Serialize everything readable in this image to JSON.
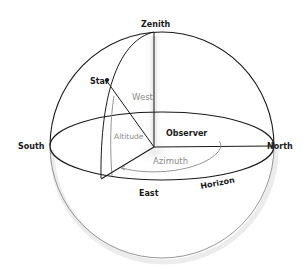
{
  "diagram": {
    "labels": {
      "zenith": "Zenith",
      "star": "Star",
      "west": "West",
      "south": "South",
      "north": "North",
      "east": "East",
      "altitude": "Altitude",
      "observer": "Observer",
      "azimuth": "Azimuth",
      "horizon": "Horizon"
    },
    "colors": {
      "line": "#1a1a1a",
      "muted_line": "#8a8a8a",
      "muted_text": "#8a8a8a",
      "shadow": "#d8d8d8"
    }
  }
}
